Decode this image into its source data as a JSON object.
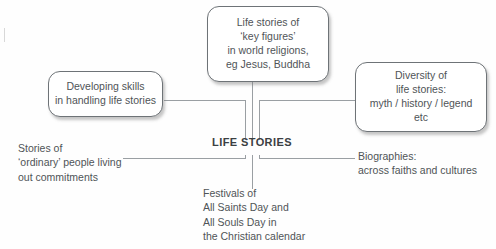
{
  "diagram": {
    "type": "spider-mind-map",
    "center": {
      "label": "LIFE STORIES"
    },
    "boxes": [
      {
        "id": "key-figures",
        "position": "top",
        "lines": [
          "Life stories of",
          "‘key figures’",
          "in world religions,",
          "eg Jesus, Buddha"
        ]
      },
      {
        "id": "developing-skills",
        "position": "left",
        "lines": [
          "Developing skills",
          "in handling life stories"
        ]
      },
      {
        "id": "diversity",
        "position": "right",
        "lines": [
          "Diversity of",
          "life stories:",
          "myth / history / legend",
          "etc"
        ]
      }
    ],
    "labels": [
      {
        "id": "ordinary-people",
        "position": "bottom-left",
        "lines": [
          "Stories of",
          "‘ordinary’ people living",
          "out commitments"
        ]
      },
      {
        "id": "biographies",
        "position": "bottom-right",
        "lines": [
          "Biographies:",
          "across faiths and cultures"
        ]
      },
      {
        "id": "festivals",
        "position": "bottom",
        "lines": [
          "Festivals of",
          "All Saints Day and",
          "All Souls Day in",
          "the Christian calendar"
        ]
      }
    ],
    "colors": {
      "line": "#9a9fa3",
      "box_border": "#6e7377",
      "text": "#4f5457",
      "title": "#3b4043",
      "background": "#fefefe"
    }
  }
}
